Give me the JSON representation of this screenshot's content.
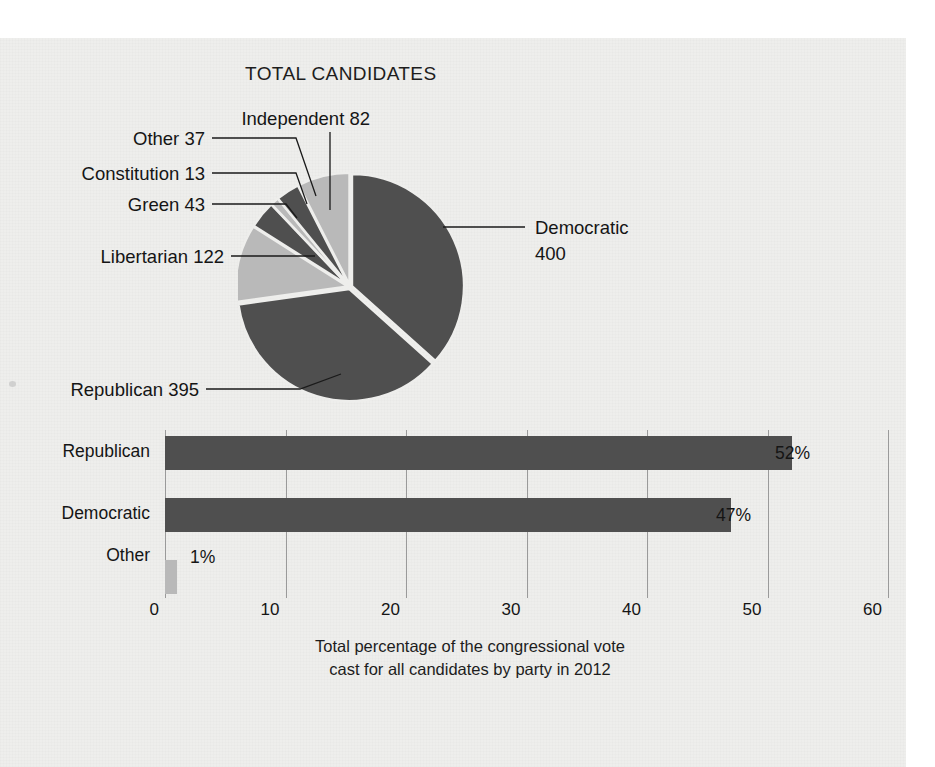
{
  "figure": {
    "pie_title": "TOTAL CANDIDATES",
    "caption_line1": "Total percentage of the congressional vote",
    "caption_line2": "cast for all candidates by party in 2012"
  },
  "colors": {
    "dark": "#4f4f4f",
    "light": "#b9b9b9",
    "paper": "#eeeeec",
    "ink": "#151515",
    "grid": "#9a9a9a"
  },
  "chart_data": [
    {
      "type": "pie",
      "title": "TOTAL CANDIDATES",
      "unit": "candidates",
      "total": 1092,
      "start_angle_deg": 0,
      "direction": "clockwise",
      "legend": "callout-labels",
      "slices": [
        {
          "label": "Democratic",
          "label_line1": "Democratic",
          "label_line2": "400",
          "value": 400,
          "display": "Democratic 400",
          "shade": "dark"
        },
        {
          "label": "Republican",
          "label_line1": "Republican 395",
          "label_line2": "",
          "value": 395,
          "display": "Republican 395",
          "shade": "dark"
        },
        {
          "label": "Libertarian",
          "label_line1": "Libertarian 122",
          "label_line2": "",
          "value": 122,
          "display": "Libertarian 122",
          "shade": "light"
        },
        {
          "label": "Green",
          "label_line1": "Green 43",
          "label_line2": "",
          "value": 43,
          "display": "Green 43",
          "shade": "dark"
        },
        {
          "label": "Constitution",
          "label_line1": "Constitution 13",
          "label_line2": "",
          "value": 13,
          "display": "Constitution 13",
          "shade": "light"
        },
        {
          "label": "Other",
          "label_line1": "Other 37",
          "label_line2": "",
          "value": 37,
          "display": "Other 37",
          "shade": "dark"
        },
        {
          "label": "Independent",
          "label_line1": "Independent 82",
          "label_line2": "",
          "value": 82,
          "display": "Independent 82",
          "shade": "light"
        }
      ]
    },
    {
      "type": "bar",
      "orientation": "horizontal",
      "title": "",
      "xlabel": "",
      "ylabel": "",
      "xlim": [
        0,
        60
      ],
      "xticks": [
        0,
        10,
        20,
        30,
        40,
        50,
        60
      ],
      "xtick_labels": [
        "0",
        "10",
        "20",
        "30",
        "40",
        "50",
        "60"
      ],
      "grid": true,
      "categories": [
        "Republican",
        "Democratic",
        "Other"
      ],
      "values": [
        52,
        47,
        1
      ],
      "value_labels": [
        "52%",
        "47%",
        "1%"
      ],
      "bar_shades": [
        "dark",
        "dark",
        "light"
      ],
      "caption": "Total percentage of the congressional vote cast for all candidates by party in 2012"
    }
  ]
}
